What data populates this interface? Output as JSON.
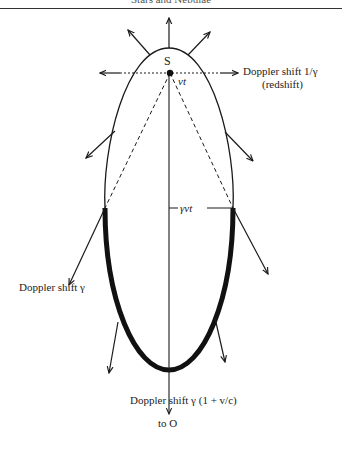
{
  "header": {
    "running_title": "Stars and Nebulae"
  },
  "diagram": {
    "source_label": "S",
    "displacement_label": "vt",
    "width_label": "γvt",
    "labels": {
      "right_top": {
        "line1": "Doppler shift 1/γ",
        "line2": "(redshift)"
      },
      "left_mid": "Doppler shift γ",
      "bottom": "Doppler shift γ (1 + v/c)",
      "observer": "to O"
    },
    "colors": {
      "ink": "#1a1a1a",
      "thick_arc": "#111111"
    }
  }
}
